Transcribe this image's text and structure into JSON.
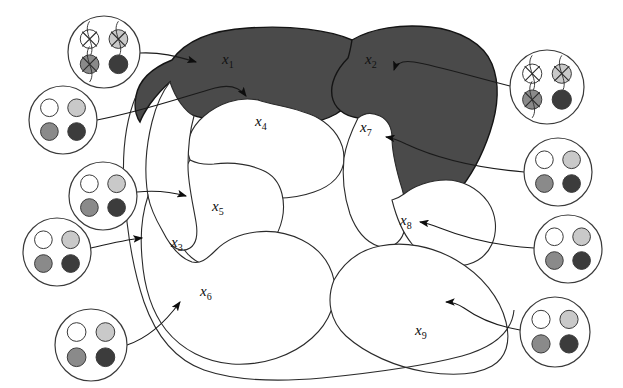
{
  "figure": {
    "title": "Partitioned region diagram with state nodes",
    "background_color": "#ffffff",
    "shaded_color": "#4a4a4a",
    "outline_color": "#1a1a1a",
    "line_color": "#2b2b2b"
  },
  "regions": [
    {
      "id": "x1",
      "label": "x",
      "sub": "1",
      "shaded": true,
      "label_x": 222,
      "label_y": 51,
      "on_dark": true
    },
    {
      "id": "x2",
      "label": "x",
      "sub": "2",
      "shaded": true,
      "label_x": 365,
      "label_y": 51,
      "on_dark": true
    },
    {
      "id": "x3",
      "label": "x",
      "sub": "3",
      "shaded": false,
      "label_x": 171,
      "label_y": 234,
      "on_dark": false
    },
    {
      "id": "x4",
      "label": "x",
      "sub": "4",
      "shaded": false,
      "label_x": 255,
      "label_y": 113,
      "on_dark": false
    },
    {
      "id": "x5",
      "label": "x",
      "sub": "5",
      "shaded": false,
      "label_x": 212,
      "label_y": 198,
      "on_dark": false
    },
    {
      "id": "x6",
      "label": "x",
      "sub": "6",
      "shaded": false,
      "label_x": 200,
      "label_y": 283,
      "on_dark": false
    },
    {
      "id": "x7",
      "label": "x",
      "sub": "7",
      "shaded": false,
      "label_x": 360,
      "label_y": 119,
      "on_dark": false
    },
    {
      "id": "x8",
      "label": "x",
      "sub": "8",
      "shaded": false,
      "label_x": 400,
      "label_y": 212,
      "on_dark": false
    },
    {
      "id": "x9",
      "label": "x",
      "sub": "9",
      "shaded": false,
      "label_x": 415,
      "label_y": 322,
      "on_dark": false
    }
  ],
  "dot_palette": {
    "white": "#ffffff",
    "light_gray": "#c9c9c9",
    "mid_gray": "#8a8a8a",
    "dark_gray": "#3c3c3c",
    "stroke": "#3a3a3a"
  },
  "nodes": [
    {
      "id": "node-1",
      "cx": 104,
      "cy": 52,
      "r": 36,
      "points_to": "x1",
      "dots": [
        {
          "pos": "top-left",
          "fill": "white",
          "crossed": true
        },
        {
          "pos": "top-right",
          "fill": "light_gray",
          "crossed": true
        },
        {
          "pos": "bottom-left",
          "fill": "mid_gray",
          "crossed": true
        },
        {
          "pos": "bottom-right",
          "fill": "dark_gray",
          "crossed": false
        }
      ]
    },
    {
      "id": "node-2",
      "cx": 63,
      "cy": 120,
      "r": 34,
      "points_to": "x1",
      "dots": [
        {
          "pos": "top-left",
          "fill": "white",
          "crossed": false
        },
        {
          "pos": "top-right",
          "fill": "light_gray",
          "crossed": false
        },
        {
          "pos": "bottom-left",
          "fill": "mid_gray",
          "crossed": false
        },
        {
          "pos": "bottom-right",
          "fill": "dark_gray",
          "crossed": false
        }
      ]
    },
    {
      "id": "node-3",
      "cx": 103,
      "cy": 196,
      "r": 34,
      "points_to": "x5",
      "dots": [
        {
          "pos": "top-left",
          "fill": "white",
          "crossed": false
        },
        {
          "pos": "top-right",
          "fill": "light_gray",
          "crossed": false
        },
        {
          "pos": "bottom-left",
          "fill": "mid_gray",
          "crossed": false
        },
        {
          "pos": "bottom-right",
          "fill": "dark_gray",
          "crossed": false
        }
      ]
    },
    {
      "id": "node-4",
      "cx": 57,
      "cy": 252,
      "r": 34,
      "points_to": "x3",
      "dots": [
        {
          "pos": "top-left",
          "fill": "white",
          "crossed": false
        },
        {
          "pos": "top-right",
          "fill": "light_gray",
          "crossed": false
        },
        {
          "pos": "bottom-left",
          "fill": "mid_gray",
          "crossed": false
        },
        {
          "pos": "bottom-right",
          "fill": "dark_gray",
          "crossed": false
        }
      ]
    },
    {
      "id": "node-5",
      "cx": 91,
      "cy": 345,
      "r": 36,
      "points_to": "x6",
      "dots": [
        {
          "pos": "top-left",
          "fill": "white",
          "crossed": false
        },
        {
          "pos": "top-right",
          "fill": "light_gray",
          "crossed": false
        },
        {
          "pos": "bottom-left",
          "fill": "mid_gray",
          "crossed": false
        },
        {
          "pos": "bottom-right",
          "fill": "dark_gray",
          "crossed": false
        }
      ]
    },
    {
      "id": "node-6",
      "cx": 547,
      "cy": 87,
      "r": 37,
      "points_to": "x2",
      "dots": [
        {
          "pos": "top-left",
          "fill": "white",
          "crossed": true
        },
        {
          "pos": "top-right",
          "fill": "light_gray",
          "crossed": true
        },
        {
          "pos": "bottom-left",
          "fill": "mid_gray",
          "crossed": true
        },
        {
          "pos": "bottom-right",
          "fill": "dark_gray",
          "crossed": false
        }
      ]
    },
    {
      "id": "node-7",
      "cx": 558,
      "cy": 172,
      "r": 34,
      "points_to": "x7",
      "dots": [
        {
          "pos": "top-left",
          "fill": "white",
          "crossed": false
        },
        {
          "pos": "top-right",
          "fill": "light_gray",
          "crossed": false
        },
        {
          "pos": "bottom-left",
          "fill": "mid_gray",
          "crossed": false
        },
        {
          "pos": "bottom-right",
          "fill": "dark_gray",
          "crossed": false
        }
      ]
    },
    {
      "id": "node-8",
      "cx": 568,
      "cy": 249,
      "r": 34,
      "points_to": "x8",
      "dots": [
        {
          "pos": "top-left",
          "fill": "white",
          "crossed": false
        },
        {
          "pos": "top-right",
          "fill": "light_gray",
          "crossed": false
        },
        {
          "pos": "bottom-left",
          "fill": "mid_gray",
          "crossed": false
        },
        {
          "pos": "bottom-right",
          "fill": "dark_gray",
          "crossed": false
        }
      ]
    },
    {
      "id": "node-9",
      "cx": 555,
      "cy": 332,
      "r": 35,
      "points_to": "x9",
      "dots": [
        {
          "pos": "top-left",
          "fill": "white",
          "crossed": false
        },
        {
          "pos": "top-right",
          "fill": "light_gray",
          "crossed": false
        },
        {
          "pos": "bottom-left",
          "fill": "mid_gray",
          "crossed": false
        },
        {
          "pos": "bottom-right",
          "fill": "dark_gray",
          "crossed": false
        }
      ]
    }
  ]
}
